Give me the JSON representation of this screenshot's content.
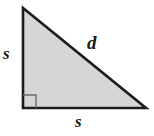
{
  "figure": {
    "type": "right-triangle-diagram",
    "background_color": "#ffffff",
    "fill_color": "#d6d6d6",
    "stroke_color": "#1c1c1c",
    "stroke_width": 2.6,
    "vertices": {
      "apex": {
        "x": 23,
        "y": 8
      },
      "right_angle": {
        "x": 23,
        "y": 108
      },
      "bottom_right": {
        "x": 146,
        "y": 108
      }
    },
    "right_angle_marker": {
      "name": "right-angle-square",
      "size": 13,
      "stroke_color": "#6b6b6b",
      "stroke_width": 1.4
    },
    "labels": {
      "vertical_leg": "s",
      "hypotenuse": "d",
      "horizontal_leg": "s"
    }
  }
}
